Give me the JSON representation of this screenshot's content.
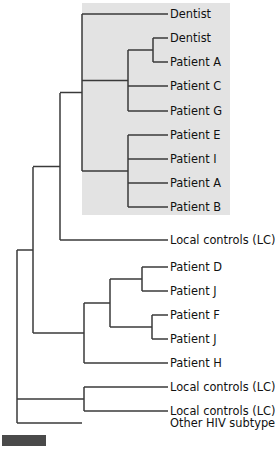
{
  "figure": {
    "type": "phylogenetic-tree",
    "width": 275,
    "height": 450,
    "background_color": "#ffffff",
    "branch_color": "#3a3a3a",
    "label_color": "#111111",
    "highlight_color": "#e3e3e3"
  },
  "highlight_box": {
    "name": "dental-practice-clade-highlight",
    "x": 82,
    "y": 3,
    "width": 148,
    "height": 212
  },
  "scale_bar": {
    "name": "scale-bar",
    "x": 2,
    "y": 435,
    "width": 44,
    "height": 11,
    "color": "#4a4a4a"
  },
  "leaves": [
    {
      "label": "Dentist",
      "y": 14,
      "tip_x": 168,
      "parent_x": 82,
      "highlighted": true
    },
    {
      "label": "Dentist",
      "y": 38,
      "tip_x": 168,
      "parent_x": 153,
      "highlighted": true
    },
    {
      "label": "Patient A",
      "y": 62,
      "tip_x": 168,
      "parent_x": 153,
      "highlighted": true
    },
    {
      "label": "Patient C",
      "y": 86,
      "tip_x": 168,
      "parent_x": 128,
      "highlighted": true
    },
    {
      "label": "Patient G",
      "y": 111,
      "tip_x": 168,
      "parent_x": 128,
      "highlighted": true
    },
    {
      "label": "Patient E",
      "y": 135,
      "tip_x": 168,
      "parent_x": 128,
      "highlighted": true
    },
    {
      "label": "Patient I",
      "y": 159,
      "tip_x": 168,
      "parent_x": 128,
      "highlighted": true
    },
    {
      "label": "Patient A",
      "y": 183,
      "tip_x": 168,
      "parent_x": 128,
      "highlighted": true
    },
    {
      "label": "Patient B",
      "y": 207,
      "tip_x": 168,
      "parent_x": 128,
      "highlighted": true
    },
    {
      "label": "Local controls (LC)",
      "y": 240,
      "tip_x": 168,
      "parent_x": 60,
      "highlighted": false
    },
    {
      "label": "Patient D",
      "y": 267,
      "tip_x": 168,
      "parent_x": 142,
      "highlighted": false
    },
    {
      "label": "Patient J",
      "y": 291,
      "tip_x": 168,
      "parent_x": 142,
      "highlighted": false
    },
    {
      "label": "Patient F",
      "y": 315,
      "tip_x": 168,
      "parent_x": 152,
      "highlighted": false
    },
    {
      "label": "Patient J",
      "y": 339,
      "tip_x": 168,
      "parent_x": 152,
      "highlighted": false
    },
    {
      "label": "Patient H",
      "y": 363,
      "tip_x": 168,
      "parent_x": 84,
      "highlighted": false
    },
    {
      "label": "Local controls (LC)",
      "y": 387,
      "tip_x": 168,
      "parent_x": 84,
      "highlighted": false
    },
    {
      "label": "Local controls (LC)",
      "y": 411,
      "tip_x": 168,
      "parent_x": 84,
      "highlighted": false
    },
    {
      "label": "Other HIV subtypes",
      "y": 423,
      "tip_x": 82,
      "parent_x": 17,
      "highlighted": false
    }
  ],
  "label_offset_x": 170,
  "internal_nodes": [
    {
      "name": "node-dentist2-patientA",
      "x": 153,
      "y_top": 38,
      "y_bottom": 62,
      "stem_to_x": 128
    },
    {
      "name": "node-upper-subclade",
      "x": 128,
      "y_top": 50,
      "y_bottom": 111,
      "stem_to_x": 82
    },
    {
      "name": "node-lower-subclade",
      "x": 128,
      "y_top": 135,
      "y_bottom": 207,
      "stem_to_x": 82
    },
    {
      "name": "node-gray-clade-root",
      "x": 82,
      "y_top": 14,
      "y_bottom": 171,
      "stem_to_x": 60
    },
    {
      "name": "node-clade-plus-lc",
      "x": 60,
      "y_top": 93,
      "y_bottom": 240,
      "stem_to_x": 33
    },
    {
      "name": "node-patientD-J",
      "x": 142,
      "y_top": 267,
      "y_bottom": 291,
      "stem_to_x": 110
    },
    {
      "name": "node-patientF-J",
      "x": 152,
      "y_top": 315,
      "y_bottom": 339,
      "stem_to_x": 110
    },
    {
      "name": "node-patient-DJFJ",
      "x": 110,
      "y_top": 279,
      "y_bottom": 327,
      "stem_to_x": 84
    },
    {
      "name": "node-patient-group-H",
      "x": 84,
      "y_top": 303,
      "y_bottom": 363,
      "stem_to_x": 33
    },
    {
      "name": "node-second-clade",
      "x": 33,
      "y_top": 167,
      "y_bottom": 333,
      "stem_to_x": 17
    },
    {
      "name": "node-lc-pair",
      "x": 84,
      "y_top": 387,
      "y_bottom": 411,
      "stem_to_x": 17
    },
    {
      "name": "node-root",
      "x": 17,
      "y_top": 250,
      "y_bottom": 423,
      "stem_to_x": 17
    }
  ]
}
